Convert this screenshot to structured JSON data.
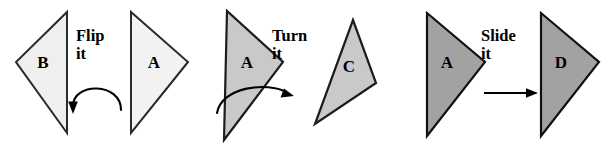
{
  "figure": {
    "width": 613,
    "height": 147,
    "background": "#ffffff"
  },
  "panels": [
    {
      "name": "flip",
      "operation_verb": "Flip",
      "operation_suffix": "it",
      "arrow_icon": "curved-arrow-left-icon",
      "source": {
        "label": "B",
        "fill": "#efefef",
        "stroke": "#2a2a2a",
        "orientation": "points-left"
      },
      "result": {
        "label": "A",
        "fill": "#f2f2f2",
        "stroke": "#2a2a2a",
        "orientation": "points-right"
      }
    },
    {
      "name": "turn",
      "operation_verb": "Turn",
      "operation_suffix": "it",
      "arrow_icon": "curved-arrow-right-icon",
      "source": {
        "label": "A",
        "fill": "#c9c9c9",
        "stroke": "#1c1c1c",
        "orientation": "points-right"
      },
      "result": {
        "label": "C",
        "fill": "#c9c9c9",
        "stroke": "#1c1c1c",
        "orientation": "rotated"
      }
    },
    {
      "name": "slide",
      "operation_verb": "Slide",
      "operation_suffix": "it",
      "arrow_icon": "straight-arrow-right-icon",
      "source": {
        "label": "A",
        "fill": "#a2a2a2",
        "stroke": "#111111",
        "orientation": "points-right"
      },
      "result": {
        "label": "D",
        "fill": "#a2a2a2",
        "stroke": "#111111",
        "orientation": "points-right"
      }
    }
  ]
}
